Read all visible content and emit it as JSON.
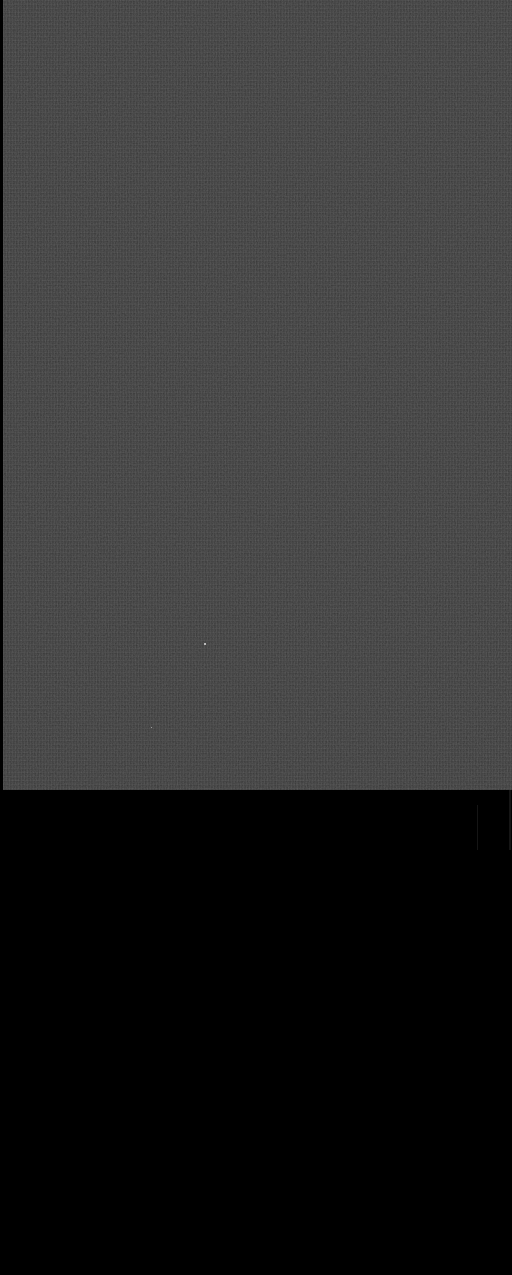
{
  "image": {
    "description": "Grainy dark gray noise panel on black background",
    "panel_color": "#3c3c3c",
    "background_color": "#000000"
  }
}
